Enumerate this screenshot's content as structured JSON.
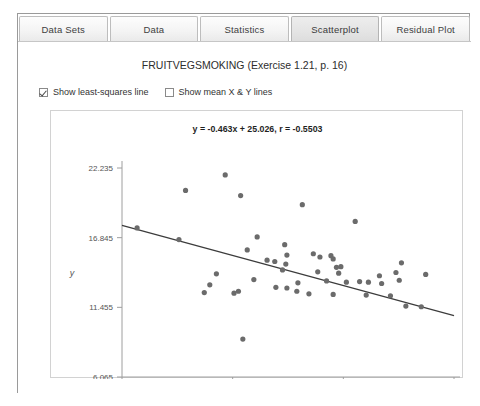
{
  "window": {
    "tabs": [
      {
        "label": "Data Sets",
        "active": false
      },
      {
        "label": "Data",
        "active": false
      },
      {
        "label": "Statistics",
        "active": false
      },
      {
        "label": "Scatterplot",
        "active": true
      },
      {
        "label": "Residual Plot",
        "active": false
      }
    ]
  },
  "chart_panel": {
    "title": "FRUITVEGSMOKING (Exercise 1.21, p. 16)",
    "options": [
      {
        "label": "Show least-squares line",
        "checked": true
      },
      {
        "label": "Show mean X & Y lines",
        "checked": false
      }
    ],
    "equation": "y = -0.463x + 25.026, r = -0.5503"
  },
  "chart_data": {
    "type": "scatter",
    "title": "FRUITVEGSMOKING (Exercise 1.21, p. 16)",
    "annotation": "y = -0.463x + 25.026, r = -0.5503",
    "xlabel": "x",
    "ylabel": "y",
    "grid": false,
    "legend": "none",
    "xlim": [
      15.615,
      30.685
    ],
    "ylim": [
      6.065,
      22.235
    ],
    "xticks": [
      15.615,
      20.638,
      25.662,
      30.685
    ],
    "yticks": [
      6.065,
      11.455,
      16.845,
      22.235
    ],
    "point_color": "#6b6b6b",
    "line_color": "#3c3c3c",
    "fit_line": {
      "slope": -0.463,
      "intercept": 25.026,
      "r": -0.5503,
      "x_start": 15.615,
      "x_end": 30.685,
      "y_start": 17.795,
      "y_end": 10.81
    },
    "points": [
      [
        16.3,
        17.6
      ],
      [
        18.5,
        20.5
      ],
      [
        20.3,
        21.7
      ],
      [
        21.0,
        20.1
      ],
      [
        23.8,
        19.4
      ],
      [
        18.2,
        16.7
      ],
      [
        21.3,
        15.9
      ],
      [
        21.75,
        16.9
      ],
      [
        23.0,
        16.3
      ],
      [
        23.1,
        15.5
      ],
      [
        23.05,
        14.8
      ],
      [
        22.2,
        15.1
      ],
      [
        22.55,
        15.0
      ],
      [
        19.6,
        13.2
      ],
      [
        20.9,
        12.7
      ],
      [
        19.9,
        14.05
      ],
      [
        19.35,
        12.6
      ],
      [
        20.7,
        12.55
      ],
      [
        22.6,
        13.0
      ],
      [
        23.1,
        12.95
      ],
      [
        23.6,
        13.35
      ],
      [
        23.55,
        12.7
      ],
      [
        24.3,
        15.6
      ],
      [
        24.6,
        15.35
      ],
      [
        25.1,
        15.45
      ],
      [
        25.2,
        15.2
      ],
      [
        25.35,
        14.55
      ],
      [
        25.55,
        14.6
      ],
      [
        25.45,
        14.1
      ],
      [
        24.5,
        14.2
      ],
      [
        24.9,
        13.5
      ],
      [
        25.8,
        13.4
      ],
      [
        26.4,
        13.45
      ],
      [
        26.8,
        13.4
      ],
      [
        27.3,
        13.9
      ],
      [
        27.4,
        13.3
      ],
      [
        28.2,
        13.55
      ],
      [
        28.3,
        14.9
      ],
      [
        28.05,
        14.15
      ],
      [
        29.4,
        14.0
      ],
      [
        25.2,
        12.45
      ],
      [
        26.7,
        12.4
      ],
      [
        27.8,
        12.35
      ],
      [
        28.5,
        11.55
      ],
      [
        24.1,
        12.5
      ],
      [
        22.9,
        14.35
      ],
      [
        21.6,
        13.6
      ],
      [
        29.2,
        11.5
      ],
      [
        21.1,
        9.0
      ],
      [
        26.2,
        18.1
      ]
    ]
  }
}
